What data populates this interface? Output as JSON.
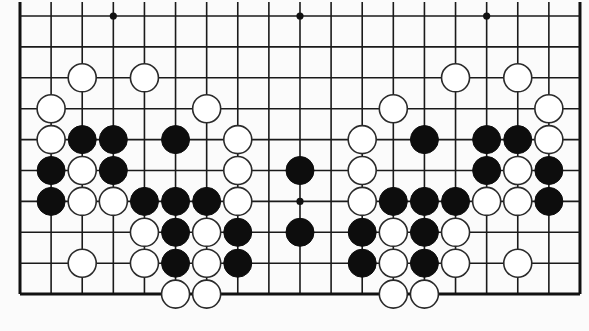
{
  "board": {
    "columns": 19,
    "rows_visible": 10,
    "origin_x": 20,
    "origin_y": 16,
    "spacing_x": 31.11,
    "spacing_y": 30.9,
    "top_open": true,
    "top_extension_y": 2,
    "edges": [
      "left",
      "right",
      "bottom"
    ],
    "stone_radius": 14,
    "colors": {
      "background": "#fbfbfb",
      "line": "#1a1a1a",
      "black_stone": "#0d0d0d",
      "white_stone": "#ffffff",
      "white_outline": "#2a2a2a"
    },
    "star_points": [
      {
        "c": 3,
        "r": 0
      },
      {
        "c": 9,
        "r": 0
      },
      {
        "c": 15,
        "r": 0
      },
      {
        "c": 9,
        "r": 6
      }
    ],
    "stones": [
      {
        "c": 2,
        "r": 2,
        "color": "white"
      },
      {
        "c": 4,
        "r": 2,
        "color": "white"
      },
      {
        "c": 14,
        "r": 2,
        "color": "white"
      },
      {
        "c": 16,
        "r": 2,
        "color": "white"
      },
      {
        "c": 1,
        "r": 3,
        "color": "white"
      },
      {
        "c": 6,
        "r": 3,
        "color": "white"
      },
      {
        "c": 12,
        "r": 3,
        "color": "white"
      },
      {
        "c": 17,
        "r": 3,
        "color": "white"
      },
      {
        "c": 1,
        "r": 4,
        "color": "white"
      },
      {
        "c": 2,
        "r": 4,
        "color": "black"
      },
      {
        "c": 3,
        "r": 4,
        "color": "black"
      },
      {
        "c": 5,
        "r": 4,
        "color": "black"
      },
      {
        "c": 7,
        "r": 4,
        "color": "white"
      },
      {
        "c": 11,
        "r": 4,
        "color": "white"
      },
      {
        "c": 13,
        "r": 4,
        "color": "black"
      },
      {
        "c": 15,
        "r": 4,
        "color": "black"
      },
      {
        "c": 16,
        "r": 4,
        "color": "black"
      },
      {
        "c": 17,
        "r": 4,
        "color": "white"
      },
      {
        "c": 1,
        "r": 5,
        "color": "black"
      },
      {
        "c": 2,
        "r": 5,
        "color": "white"
      },
      {
        "c": 3,
        "r": 5,
        "color": "black"
      },
      {
        "c": 7,
        "r": 5,
        "color": "white"
      },
      {
        "c": 9,
        "r": 5,
        "color": "black"
      },
      {
        "c": 11,
        "r": 5,
        "color": "white"
      },
      {
        "c": 15,
        "r": 5,
        "color": "black"
      },
      {
        "c": 16,
        "r": 5,
        "color": "white"
      },
      {
        "c": 17,
        "r": 5,
        "color": "black"
      },
      {
        "c": 1,
        "r": 6,
        "color": "black"
      },
      {
        "c": 2,
        "r": 6,
        "color": "white"
      },
      {
        "c": 3,
        "r": 6,
        "color": "white"
      },
      {
        "c": 4,
        "r": 6,
        "color": "black"
      },
      {
        "c": 5,
        "r": 6,
        "color": "black"
      },
      {
        "c": 6,
        "r": 6,
        "color": "black"
      },
      {
        "c": 7,
        "r": 6,
        "color": "white"
      },
      {
        "c": 11,
        "r": 6,
        "color": "white"
      },
      {
        "c": 12,
        "r": 6,
        "color": "black"
      },
      {
        "c": 13,
        "r": 6,
        "color": "black"
      },
      {
        "c": 14,
        "r": 6,
        "color": "black"
      },
      {
        "c": 15,
        "r": 6,
        "color": "white"
      },
      {
        "c": 16,
        "r": 6,
        "color": "white"
      },
      {
        "c": 17,
        "r": 6,
        "color": "black"
      },
      {
        "c": 4,
        "r": 7,
        "color": "white"
      },
      {
        "c": 5,
        "r": 7,
        "color": "black"
      },
      {
        "c": 6,
        "r": 7,
        "color": "white"
      },
      {
        "c": 7,
        "r": 7,
        "color": "black"
      },
      {
        "c": 9,
        "r": 7,
        "color": "black"
      },
      {
        "c": 11,
        "r": 7,
        "color": "black"
      },
      {
        "c": 12,
        "r": 7,
        "color": "white"
      },
      {
        "c": 13,
        "r": 7,
        "color": "black"
      },
      {
        "c": 14,
        "r": 7,
        "color": "white"
      },
      {
        "c": 2,
        "r": 8,
        "color": "white"
      },
      {
        "c": 4,
        "r": 8,
        "color": "white"
      },
      {
        "c": 5,
        "r": 8,
        "color": "black"
      },
      {
        "c": 6,
        "r": 8,
        "color": "white"
      },
      {
        "c": 7,
        "r": 8,
        "color": "black"
      },
      {
        "c": 11,
        "r": 8,
        "color": "black"
      },
      {
        "c": 12,
        "r": 8,
        "color": "white"
      },
      {
        "c": 13,
        "r": 8,
        "color": "black"
      },
      {
        "c": 14,
        "r": 8,
        "color": "white"
      },
      {
        "c": 16,
        "r": 8,
        "color": "white"
      },
      {
        "c": 5,
        "r": 9,
        "color": "white"
      },
      {
        "c": 6,
        "r": 9,
        "color": "white"
      },
      {
        "c": 12,
        "r": 9,
        "color": "white"
      },
      {
        "c": 13,
        "r": 9,
        "color": "white"
      }
    ]
  }
}
